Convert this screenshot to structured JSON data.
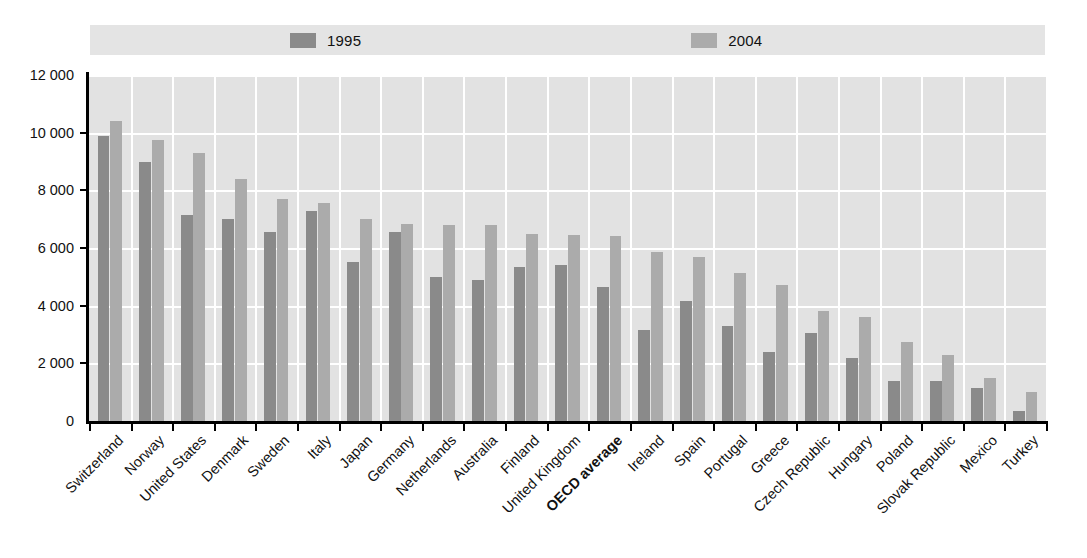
{
  "legend": {
    "entries": [
      {
        "label": "1995",
        "color": "#8a8a8a"
      },
      {
        "label": "2004",
        "color": "#ababab"
      }
    ]
  },
  "axis": {
    "y_ticks": [
      "0",
      "2 000",
      "4 000",
      "6 000",
      "8 000",
      "10 000",
      "12 000"
    ]
  },
  "chart_data": {
    "type": "bar",
    "title": "",
    "xlabel": "",
    "ylabel": "",
    "ylim": [
      0,
      12000
    ],
    "ytick_values": [
      0,
      2000,
      4000,
      6000,
      8000,
      10000,
      12000
    ],
    "grid": true,
    "legend_position": "top",
    "highlight_category": "OECD average",
    "categories": [
      "Switzerland",
      "Norway",
      "United States",
      "Denmark",
      "Sweden",
      "Italy",
      "Japan",
      "Germany",
      "Netherlands",
      "Australia",
      "Finland",
      "United Kingdom",
      "OECD average",
      "Ireland",
      "Spain",
      "Portugal",
      "Greece",
      "Czech Republic",
      "Hungary",
      "Poland",
      "Slovak Republic",
      "Mexico",
      "Turkey"
    ],
    "series": [
      {
        "name": "1995",
        "color": "#8a8a8a",
        "values": [
          9900,
          9000,
          7150,
          7000,
          6550,
          7300,
          5500,
          6550,
          5000,
          4900,
          5350,
          5400,
          4650,
          3150,
          4150,
          3300,
          2400,
          3050,
          2200,
          1400,
          1400,
          1150,
          350
        ]
      },
      {
        "name": "2004",
        "color": "#ababab",
        "values": [
          10400,
          9750,
          9300,
          8400,
          7700,
          7550,
          7000,
          6850,
          6800,
          6800,
          6500,
          6450,
          6400,
          5850,
          5700,
          5150,
          4700,
          3800,
          3600,
          2750,
          2300,
          1500,
          1000
        ]
      }
    ]
  }
}
